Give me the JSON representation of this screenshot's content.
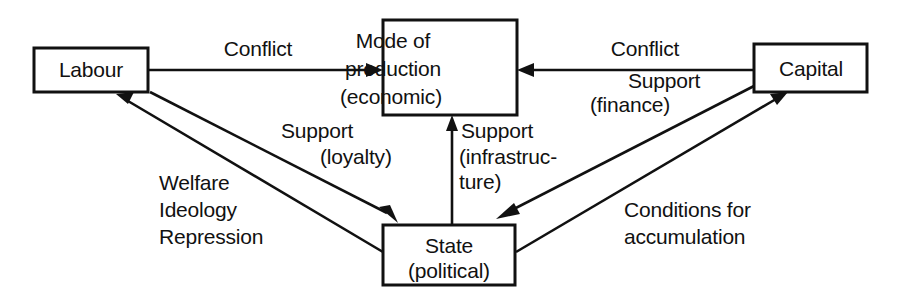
{
  "diagram": {
    "background_color": "#ffffff",
    "ink_color": "#111111",
    "nodes": [
      {
        "id": "labour",
        "lines": [
          "Labour"
        ]
      },
      {
        "id": "mode",
        "lines": [
          "Mode of",
          "production",
          "(economic)"
        ]
      },
      {
        "id": "capital",
        "lines": [
          "Capital"
        ]
      },
      {
        "id": "state",
        "lines": [
          "State",
          "(political)"
        ]
      }
    ],
    "edge_labels": {
      "labour_to_mode": [
        "Conflict"
      ],
      "capital_to_mode": [
        "Conflict"
      ],
      "capital_to_state": [
        "Support",
        "(finance)"
      ],
      "labour_to_state": [
        "Support",
        "(loyalty)"
      ],
      "state_to_mode": [
        "Support",
        "(infrastruc-",
        "ture)"
      ],
      "state_to_labour": [
        "Welfare",
        "Ideology",
        "Repression"
      ],
      "state_to_capital": [
        "Conditions for",
        "accumulation"
      ]
    }
  }
}
